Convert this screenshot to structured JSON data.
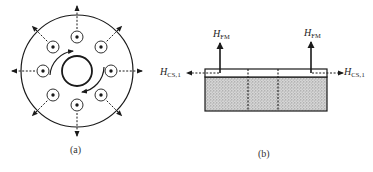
{
  "panel_a": {
    "caption": "(a)",
    "description": "Circular disk with central hole, 8 circled dots (field out of page) arranged in a ring, two curved arrows indicating rotation, and dashed radial arrows pointing outward",
    "num_dot_sites": 8,
    "rotation_arrows": 2
  },
  "panel_b": {
    "caption": "(b)",
    "left_vertical_label": {
      "main": "H",
      "sub": "FM"
    },
    "right_vertical_label": {
      "main": "H",
      "sub": "FM"
    },
    "left_horizontal_label": {
      "main": "H",
      "sub": "CS,1"
    },
    "right_horizontal_label": {
      "main": "H",
      "sub": "CS,1"
    },
    "description": "Cross-section: thin top layer over hatched substrate, divided by two dotted vertical lines; upward arrows H_FM and outward dashed arrows H_CS,1"
  },
  "colors": {
    "ink": "#1a1a1a",
    "hatch": "#b8b8b8",
    "background": "#ffffff"
  }
}
